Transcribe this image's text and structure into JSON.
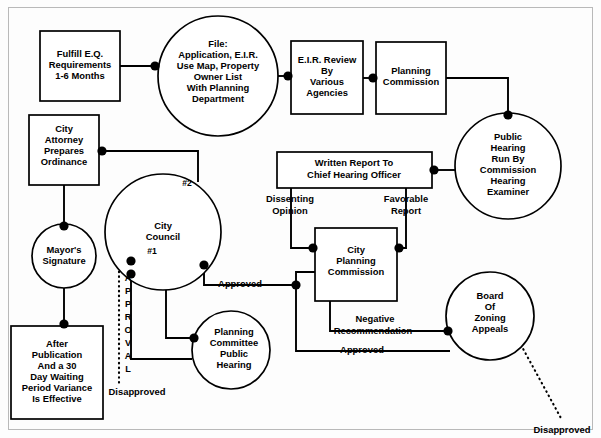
{
  "diagram": {
    "type": "flowchart",
    "background_color": "#ffffff",
    "line_color": "#000000",
    "nodes": [
      {
        "id": "fulfill-eq",
        "shape": "box",
        "lines": [
          "Fulfill E.Q.",
          "Requirements",
          "1-6 Months"
        ],
        "x": 40,
        "y": 31,
        "w": 80,
        "h": 70
      },
      {
        "id": "file-application",
        "shape": "circle",
        "lines": [
          "File:",
          "Application, E.I.R.",
          "Use Map, Property",
          "Owner List",
          "With Planning",
          "Department"
        ],
        "cx": 218,
        "cy": 76,
        "r": 60
      },
      {
        "id": "eir-review",
        "shape": "box",
        "lines": [
          "E.I.R. Review",
          "By",
          "Various",
          "Agencies"
        ],
        "x": 291,
        "y": 41,
        "w": 72,
        "h": 73
      },
      {
        "id": "planning-commission",
        "shape": "box",
        "lines": [
          "Planning",
          "Commission"
        ],
        "x": 376,
        "y": 42,
        "w": 70,
        "h": 72
      },
      {
        "id": "public-hearing-examiner",
        "shape": "circle",
        "lines": [
          "Public",
          "Hearing",
          "Run By",
          "Commission",
          "Hearing",
          "Examiner"
        ],
        "cx": 508,
        "cy": 166,
        "r": 53
      },
      {
        "id": "city-attorney",
        "shape": "box",
        "lines": [
          "City",
          "Attorney",
          "Prepares",
          "Ordinance"
        ],
        "x": 29,
        "y": 115,
        "w": 70,
        "h": 70
      },
      {
        "id": "mayors-signature",
        "shape": "circle",
        "lines": [
          "Mayor's",
          "Signature"
        ],
        "cx": 64,
        "cy": 256,
        "r": 32
      },
      {
        "id": "after-publication",
        "shape": "box",
        "lines": [
          "After",
          "Publication",
          "And a 30",
          "Day Waiting",
          "Period Variance",
          "Is Effective"
        ],
        "x": 11,
        "y": 326,
        "w": 92,
        "h": 93
      },
      {
        "id": "city-council",
        "shape": "circle",
        "lines": [
          "City",
          "Council"
        ],
        "cx": 163,
        "cy": 232,
        "r": 58
      },
      {
        "id": "planning-committee-hearing",
        "shape": "circle",
        "lines": [
          "Planning",
          "Committee",
          "Public",
          "Hearing"
        ],
        "cx": 231,
        "cy": 350,
        "r": 39
      },
      {
        "id": "written-report",
        "shape": "box",
        "lines": [
          "Written Report To",
          "Chief Hearing Officer"
        ],
        "x": 277,
        "y": 152,
        "w": 155,
        "h": 36
      },
      {
        "id": "city-planning-commission",
        "shape": "box",
        "lines": [
          "City",
          "Planning",
          "Commission"
        ],
        "x": 315,
        "y": 228,
        "w": 82,
        "h": 73
      },
      {
        "id": "board-of-zoning-appeals",
        "shape": "circle",
        "lines": [
          "Board",
          "Of",
          "Zoning",
          "Appeals"
        ],
        "cx": 490,
        "cy": 316,
        "r": 44
      }
    ],
    "markers": [
      {
        "id": "council-marker-2",
        "label": "#2",
        "x": 187,
        "y": 184
      },
      {
        "id": "council-marker-1",
        "label": "#1",
        "x": 152,
        "y": 252
      }
    ],
    "edge_labels": [
      {
        "id": "label-dissenting-opinion",
        "lines": [
          "Dissenting",
          "Opinion"
        ],
        "x": 290,
        "y": 205
      },
      {
        "id": "label-favorable-report",
        "lines": [
          "Favorable",
          "Report"
        ],
        "x": 406,
        "y": 205
      },
      {
        "id": "label-approved-council",
        "lines": [
          "Approved"
        ],
        "x": 240,
        "y": 285
      },
      {
        "id": "label-negative-recommendation",
        "lines": [
          "Negative",
          "Recommendation"
        ],
        "x": 373,
        "y": 325
      },
      {
        "id": "label-approved-board",
        "lines": [
          "Approved"
        ],
        "x": 362,
        "y": 351
      },
      {
        "id": "label-disapproved-left",
        "lines": [
          "Disapproved"
        ],
        "x": 137,
        "y": 393
      },
      {
        "id": "label-disapproved-right",
        "lines": [
          "Disapproved"
        ],
        "x": 562,
        "y": 431
      },
      {
        "id": "label-approval-vertical",
        "lines": [
          "A",
          "P",
          "P",
          "R",
          "O",
          "V",
          "A",
          "L"
        ],
        "x": 128,
        "y": 288,
        "orientation": "vertical"
      }
    ]
  }
}
